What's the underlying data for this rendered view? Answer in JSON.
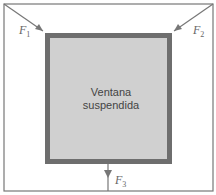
{
  "window": {
    "line1": "Ventana",
    "line2": "suspendida"
  },
  "forces": [
    {
      "name": "F",
      "sub": "1"
    },
    {
      "name": "F",
      "sub": "2"
    },
    {
      "name": "F",
      "sub": "3"
    }
  ],
  "colors": {
    "frame": "#777777",
    "window_border": "#6e6e6e",
    "window_fill": "#cfcfcf",
    "arrow": "#777777"
  }
}
